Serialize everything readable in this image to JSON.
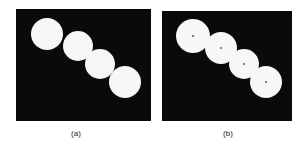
{
  "figure": {
    "panels": [
      {
        "label": "(a)",
        "circles": [
          {
            "cx": 31,
            "cy": 25,
            "r": 16
          },
          {
            "cx": 62,
            "cy": 37,
            "r": 15
          },
          {
            "cx": 84,
            "cy": 55,
            "r": 15
          },
          {
            "cx": 109,
            "cy": 73,
            "r": 16
          }
        ],
        "show_centers": false
      },
      {
        "label": "(b)",
        "circles": [
          {
            "cx": 31,
            "cy": 25,
            "r": 17
          },
          {
            "cx": 59,
            "cy": 37,
            "r": 16
          },
          {
            "cx": 82,
            "cy": 53,
            "r": 15
          },
          {
            "cx": 104,
            "cy": 71,
            "r": 16
          }
        ],
        "show_centers": true
      }
    ]
  }
}
